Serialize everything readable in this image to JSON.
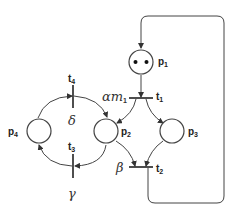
{
  "diagram": {
    "type": "petri-net",
    "places": [
      {
        "id": "p1",
        "label": "p",
        "sub": "1",
        "tokens": 2
      },
      {
        "id": "p2",
        "label": "p",
        "sub": "2",
        "tokens": 0
      },
      {
        "id": "p3",
        "label": "p",
        "sub": "3",
        "tokens": 0
      },
      {
        "id": "p4",
        "label": "p",
        "sub": "4",
        "tokens": 0
      }
    ],
    "transitions": [
      {
        "id": "t1",
        "label": "t",
        "sub": "1",
        "rate": "αm",
        "rate_sub": "1"
      },
      {
        "id": "t2",
        "label": "t",
        "sub": "2",
        "rate": "β"
      },
      {
        "id": "t3",
        "label": "t",
        "sub": "3",
        "rate": "γ"
      },
      {
        "id": "t4",
        "label": "t",
        "sub": "4",
        "rate": "δ"
      }
    ],
    "arcs": [
      {
        "from": "p1",
        "to": "t1"
      },
      {
        "from": "t1",
        "to": "p2"
      },
      {
        "from": "t1",
        "to": "p3"
      },
      {
        "from": "p2",
        "to": "t2"
      },
      {
        "from": "p3",
        "to": "t2"
      },
      {
        "from": "t2",
        "to": "p1"
      },
      {
        "from": "p2",
        "to": "t3"
      },
      {
        "from": "t3",
        "to": "p4"
      },
      {
        "from": "p4",
        "to": "t4"
      },
      {
        "from": "t4",
        "to": "p2"
      }
    ]
  }
}
